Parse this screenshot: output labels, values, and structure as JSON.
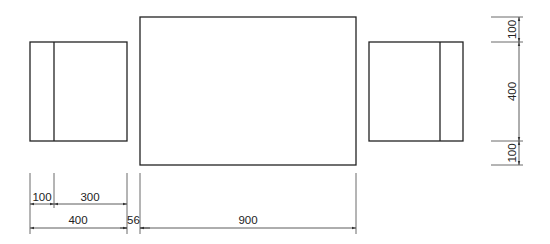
{
  "drawing": {
    "stroke_color": "#222222",
    "dim_color": "#333333",
    "shapes": {
      "left_box": {
        "label": "left-chair"
      },
      "center_box": {
        "label": "table"
      },
      "right_box": {
        "label": "right-chair"
      }
    },
    "horizontal_dims": {
      "left_part": "100",
      "right_part": "300",
      "chair_width": "400",
      "gap": "56",
      "table_width": "900"
    },
    "vertical_dims": {
      "top_margin": "100",
      "chair_depth": "400",
      "bottom_margin": "100"
    }
  }
}
